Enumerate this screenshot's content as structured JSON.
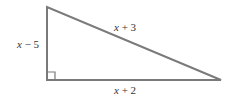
{
  "diagram": {
    "type": "right-triangle",
    "line_color": "#7a7a7a",
    "text_color": "#333333",
    "right_angle_marker": true,
    "sides": {
      "vertical_leg": {
        "label": "x − 5",
        "var": "x",
        "rest": " − 5"
      },
      "hypotenuse": {
        "label": "x + 3",
        "var": "x",
        "rest": " + 3"
      },
      "horizontal_leg": {
        "label": "x + 2",
        "var": "x",
        "rest": " + 2"
      }
    }
  }
}
